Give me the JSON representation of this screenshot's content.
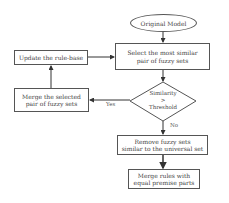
{
  "diagram": {
    "start": {
      "label": "Original Model"
    },
    "select": {
      "line1": "Select the most similar",
      "line2": "pair of fuzzy sets"
    },
    "decision": {
      "line1": "Similarity",
      "line2": ">",
      "line3": "Threshold"
    },
    "merge_selected": {
      "line1": "Merge the selected",
      "line2": "pair of fuzzy sets"
    },
    "update": {
      "label": "Update the rule-base"
    },
    "remove": {
      "line1": "Remove fuzzy sets",
      "line2": "similar to the universal set"
    },
    "merge_rules": {
      "line1": "Merge rules with",
      "line2": "equal premise parts"
    },
    "edges": {
      "yes": "Yes",
      "no": "No"
    }
  }
}
